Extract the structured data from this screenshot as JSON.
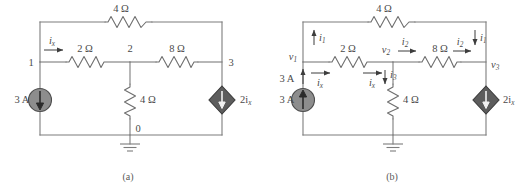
{
  "figure": {
    "background_color": "#ffffff",
    "wire_color": "#7d7d7d",
    "text_color": "#4a4a4a",
    "independent_source_color": "#8d8d8d",
    "dependent_source_color": "#5d5d5d"
  },
  "captions": {
    "a": "(a)",
    "b": "(b)"
  },
  "panel_a": {
    "name": "circuit-a",
    "components": {
      "top_resistor": "4 Ω",
      "left_series_resistor": "2 Ω",
      "right_series_resistor": "8 Ω",
      "shunt_resistor": "4 Ω",
      "current_source": "3 A",
      "dependent_source_value": "2i",
      "dependent_source_sub": "x"
    },
    "nodes": {
      "n1": "1",
      "n2": "2",
      "n3": "3",
      "n0": "0"
    },
    "currents": {
      "ix_main": "i",
      "ix_main_sub": "x"
    }
  },
  "panel_b": {
    "name": "circuit-b",
    "components": {
      "top_resistor": "4 Ω",
      "left_series_resistor": "2 Ω",
      "right_series_resistor": "8 Ω",
      "shunt_resistor": "4 Ω",
      "current_source": "3 A",
      "current_source_branch": "3 A",
      "dependent_source_value": "2i",
      "dependent_source_sub": "x"
    },
    "nodes": {
      "v1": "v",
      "v1_sub": "1",
      "v2": "v",
      "v2_sub": "2",
      "v3": "v",
      "v3_sub": "3"
    },
    "currents": {
      "i1_left": "i",
      "i1_left_sub": "1",
      "i1_right": "i",
      "i1_right_sub": "1",
      "i2_mid": "i",
      "i2_mid_sub": "2",
      "i2_right": "i",
      "i2_right_sub": "2",
      "i3": "i",
      "i3_sub": "3",
      "ix_left": "i",
      "ix_left_sub": "x",
      "ix_mid": "i",
      "ix_mid_sub": "x"
    }
  }
}
